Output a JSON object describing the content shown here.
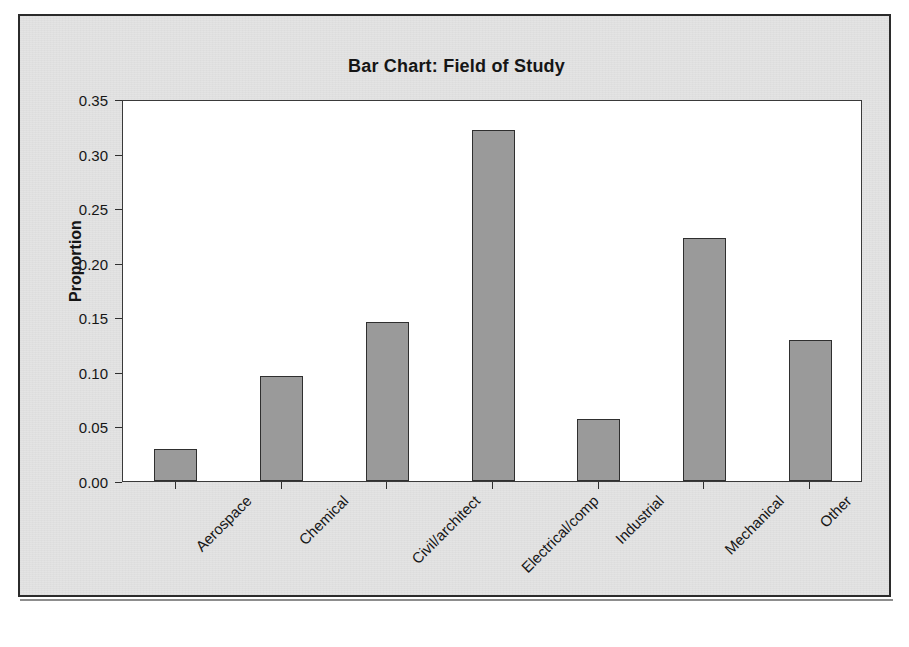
{
  "figure": {
    "title": "Bar Chart: Field of Study",
    "ylabel": "Proportion"
  },
  "chart_data": {
    "type": "bar",
    "title": "Bar Chart: Field of Study",
    "xlabel": "",
    "ylabel": "Proportion",
    "categories": [
      "Aerospace",
      "Chemical",
      "Civil/architect",
      "Electrical/comp",
      "Industrial",
      "Mechanical",
      "Other"
    ],
    "values": [
      0.029,
      0.096,
      0.146,
      0.322,
      0.057,
      0.223,
      0.129
    ],
    "ylim": [
      0.0,
      0.35
    ],
    "ytick_labels": [
      "0.00",
      "0.05",
      "0.10",
      "0.15",
      "0.20",
      "0.25",
      "0.30",
      "0.35"
    ],
    "ytick_values": [
      0.0,
      0.05,
      0.1,
      0.15,
      0.2,
      0.25,
      0.3,
      0.35
    ],
    "grid": false,
    "legend": false,
    "bar_color": "#9a9a9a",
    "bar_edge_color": "#2f2f2f",
    "plot_background": "#ffffff",
    "figure_background": "#e3e3e3",
    "xtick_label_rotation": -45
  }
}
